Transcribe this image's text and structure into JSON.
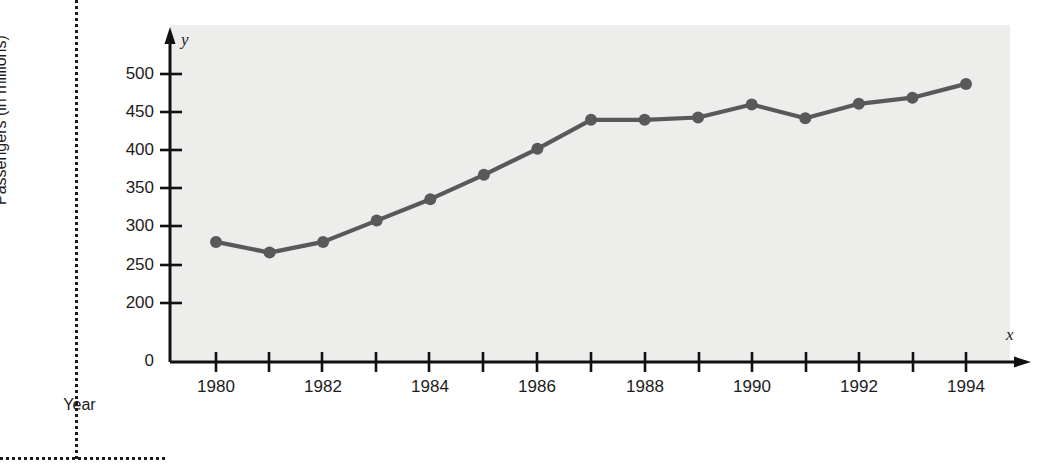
{
  "figure": {
    "top_cut_caption": "",
    "plot_background": "#ededec",
    "line_color": "#595959",
    "axis_color": "#111111",
    "x_axis_letter": "x",
    "y_axis_letter": "y"
  },
  "chart_data": {
    "type": "line",
    "title": "",
    "xlabel": "Year",
    "ylabel": "Passengers (in millions)",
    "categories": [
      1980,
      1981,
      1982,
      1983,
      1984,
      1985,
      1986,
      1987,
      1988,
      1989,
      1990,
      1991,
      1992,
      1993,
      1994
    ],
    "values": [
      280,
      266,
      280,
      308,
      336,
      368,
      402,
      440,
      440,
      443,
      460,
      442,
      461,
      469,
      487
    ],
    "x_tick_labels": [
      "1980",
      "1982",
      "1984",
      "1986",
      "1988",
      "1990",
      "1992",
      "1994"
    ],
    "x_minor_ticks": [
      "1981",
      "1983",
      "1985",
      "1987",
      "1989",
      "1991",
      "1993"
    ],
    "y_tick_labels": [
      "0",
      "200",
      "250",
      "300",
      "350",
      "400",
      "450",
      "500"
    ],
    "ylim": [
      0,
      530
    ],
    "xlim": [
      1979.2,
      1994.8
    ],
    "grid": false,
    "legend": false,
    "marker": "circle",
    "note": "y-axis compressed between 0 and 200"
  }
}
